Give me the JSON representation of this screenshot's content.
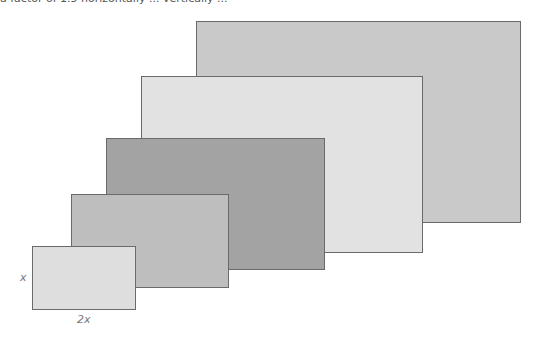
{
  "caption_fragment": "a factor of 1.5 horizontally ... vertically ...",
  "rectangles": [
    {
      "name": "rect-5",
      "left": 196,
      "top": 21,
      "width": 325,
      "height": 202,
      "fill": "#c9c9c9"
    },
    {
      "name": "rect-4",
      "left": 141,
      "top": 76,
      "width": 282,
      "height": 177,
      "fill": "#e2e2e2"
    },
    {
      "name": "rect-3",
      "left": 106,
      "top": 138,
      "width": 219,
      "height": 132,
      "fill": "#a3a3a3"
    },
    {
      "name": "rect-2",
      "left": 71,
      "top": 194,
      "width": 158,
      "height": 94,
      "fill": "#bebebe"
    },
    {
      "name": "rect-1",
      "left": 32,
      "top": 246,
      "width": 104,
      "height": 64,
      "fill": "#dedede"
    }
  ],
  "labels": {
    "height": "x",
    "width": "2x"
  }
}
